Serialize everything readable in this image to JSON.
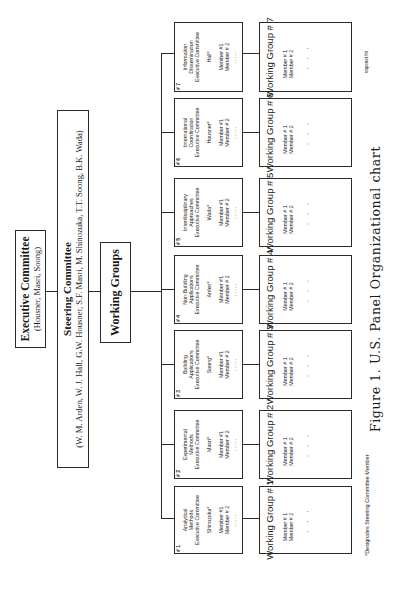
{
  "executive_committee": {
    "title": "Executive Committee",
    "members": "(Housner, Masri, Soong)"
  },
  "steering_committee": {
    "title": "Steering Committee",
    "members": "(W. M. Arden, W. J. Hall, G.W. Housner, S.F. Masri, M. Shinozuka, T.T. Soong, B.K. Wada)"
  },
  "working_groups_box": {
    "title": "Working Groups"
  },
  "committees": [
    {
      "number": "# 1",
      "name_line1": "Analytical",
      "name_line2": "Methods",
      "name_line3": "Executive Committee",
      "lead": "Shinozuka*",
      "member1": "Member #1",
      "member2": "Member # 2",
      "dots": "....."
    },
    {
      "number": "# 2",
      "name_line1": "Experimental",
      "name_line2": "Methods",
      "name_line3": "Executive Committee",
      "lead": "Masri*",
      "member1": "Member #1",
      "member2": "Member # 2",
      "dots": "....."
    },
    {
      "number": "# 3",
      "name_line1": "Building",
      "name_line2": "Applications",
      "name_line3": "Executive Committee",
      "lead": "Soong*",
      "member1": "Member #1",
      "member2": "Member # 2",
      "dots": "....."
    },
    {
      "number": "# 4",
      "name_line1": "Non-Building",
      "name_line2": "Applications",
      "name_line3": "Executive Committee",
      "lead": "Arden*",
      "member1": "Member #1",
      "member2": "Member # 2",
      "dots": "....."
    },
    {
      "number": "# 5",
      "name_line1": "Interdisciplinary",
      "name_line2": "Approaches",
      "name_line3": "Executive Committee",
      "lead": "Wada*",
      "member1": "Member #1",
      "member2": "Member # 2",
      "dots": "....."
    },
    {
      "number": "# 6",
      "name_line1": "International",
      "name_line2": "Coordination",
      "name_line3": "Executive Committee",
      "lead": "Housner*",
      "member1": "Member #1",
      "member2": "Member # 2",
      "dots": "....."
    },
    {
      "number": "# 7",
      "name_line1": "Information",
      "name_line2": "Dissemination",
      "name_line3": "Executive Committee",
      "lead": "Hall*",
      "member1": "Member #1",
      "member2": "Member # 2",
      "dots": "....."
    }
  ],
  "working_groups": [
    {
      "title": "Working Group # 1",
      "member1": "Member # 1",
      "member2": "Member # 2",
      "dots": ". . ."
    },
    {
      "title": "Working Group # 2",
      "member1": "Member # 1",
      "member2": "Member # 2",
      "dots": ". . ."
    },
    {
      "title": "Working Group # 3",
      "member1": "Member # 1",
      "member2": "Member # 2",
      "dots": ". . ."
    },
    {
      "title": "Working Group # 4",
      "member1": "Member # 1",
      "member2": "Member # 2",
      "dots": ". . ."
    },
    {
      "title": "Working Group # 5",
      "member1": "Member # 1",
      "member2": "Member # 2",
      "dots": ". . ."
    },
    {
      "title": "Working Group # 6",
      "member1": "Member # 1",
      "member2": "Member # 2",
      "dots": ". . ."
    },
    {
      "title": "Working Group # 7",
      "member1": "Member # 1",
      "member2": "Member # 2",
      "dots": ". . ."
    }
  ],
  "footnote": "*Designates Steering Committee Member",
  "file_reference": "vapenet.fm",
  "caption": "Figure 1. U.S. Panel Organizational chart"
}
